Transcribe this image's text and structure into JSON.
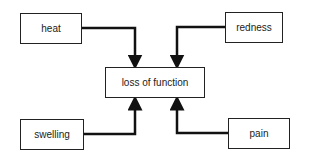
{
  "diagram": {
    "center": {
      "label": "loss of function"
    },
    "nodes": [
      {
        "id": "heat",
        "label": "heat"
      },
      {
        "id": "redness",
        "label": "redness"
      },
      {
        "id": "swelling",
        "label": "swelling"
      },
      {
        "id": "pain",
        "label": "pain"
      }
    ],
    "edges": [
      {
        "from": "heat",
        "to": "loss of function"
      },
      {
        "from": "redness",
        "to": "loss of function"
      },
      {
        "from": "swelling",
        "to": "loss of function"
      },
      {
        "from": "pain",
        "to": "loss of function"
      }
    ]
  }
}
